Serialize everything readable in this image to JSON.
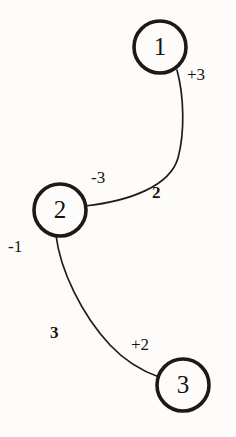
{
  "diagram": {
    "type": "directed-graph",
    "background_color": "#fdfcfa",
    "stroke_color": "#1c1a18",
    "nodes": [
      {
        "id": "1",
        "label": "1",
        "cx": 160,
        "cy": 47,
        "r": 26
      },
      {
        "id": "2",
        "label": "2",
        "cx": 60,
        "cy": 210,
        "r": 26
      },
      {
        "id": "3",
        "label": "3",
        "cx": 183,
        "cy": 385,
        "r": 26
      }
    ],
    "edges": [
      {
        "id": "edge-1-2",
        "from": "1",
        "to": "2",
        "path": "M 177 70 C 184 96 185 132 178 158 C 170 186 130 201 85 206",
        "weight_label": "2",
        "head_label": "+3",
        "tail_label": "-3"
      },
      {
        "id": "edge-2-3",
        "from": "2",
        "to": "3",
        "path": "M 56 235 C 60 270 82 315 110 345 C 126 362 145 372 159 377",
        "weight_label": "3",
        "head_label": "-1",
        "tail_label": "+2"
      }
    ],
    "labels": {
      "plus_three": "+3",
      "minus_three": "-3",
      "edge_weight_two": "2",
      "minus_one": "-1",
      "edge_weight_three": "3",
      "plus_two": "+2"
    }
  }
}
